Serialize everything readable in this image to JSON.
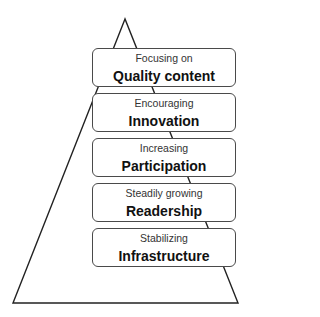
{
  "diagram": {
    "type": "pyramid",
    "levels": [
      {
        "subtitle": "Focusing on",
        "title": "Quality content"
      },
      {
        "subtitle": "Encouraging",
        "title": "Innovation"
      },
      {
        "subtitle": "Increasing",
        "title": "Participation"
      },
      {
        "subtitle": "Steadily growing",
        "title": "Readership"
      },
      {
        "subtitle": "Stabilizing",
        "title": "Infrastructure"
      }
    ]
  }
}
